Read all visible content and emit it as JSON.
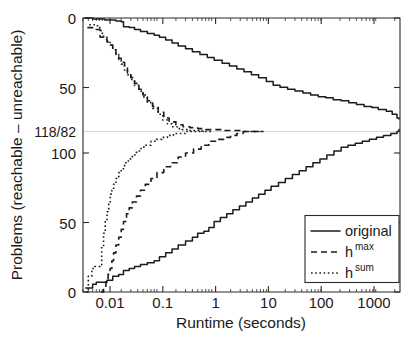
{
  "chart_data": {
    "type": "line",
    "title": "",
    "xlabel": "Runtime (seconds)",
    "ylabel": "Problems (reachable – unreachable)",
    "xscale": "log",
    "xlim": [
      0.004,
      2500
    ],
    "xticks": [
      0.01,
      0.1,
      1,
      10,
      100,
      1000
    ],
    "xticklabels": [
      "0.01",
      "0.1",
      "1",
      "10",
      "100",
      "1000"
    ],
    "yticklabels_top_to_bottom": [
      "0",
      "50",
      "118/82",
      "100",
      "50",
      "0"
    ],
    "ytick_values": [
      0,
      50,
      118,
      100,
      50,
      0
    ],
    "y_axis_note": "Mirrored axis: upper half counts reachable problems solved (0 at top, increasing downward to 118); lower half counts unreachable problems solved (0 at bottom, increasing upward to 82). The 118/82 gridline marks the shared maximum.",
    "reachable_total": 118,
    "unreachable_total": 82,
    "gridline_label": "118/82",
    "grid": "single horizontal gridline at 118/82",
    "legend_position": "lower right",
    "legend": [
      "original",
      "h^max",
      "h^sum"
    ],
    "series": [
      {
        "name": "original",
        "style": "solid",
        "half": "upper",
        "points": [
          [
            0.0045,
            0
          ],
          [
            0.006,
            1
          ],
          [
            0.008,
            1
          ],
          [
            0.01,
            2
          ],
          [
            0.013,
            2
          ],
          [
            0.016,
            3
          ],
          [
            0.02,
            4
          ],
          [
            0.022,
            9
          ],
          [
            0.028,
            10
          ],
          [
            0.035,
            12
          ],
          [
            0.045,
            14
          ],
          [
            0.06,
            16
          ],
          [
            0.08,
            18
          ],
          [
            0.1,
            20
          ],
          [
            0.13,
            23
          ],
          [
            0.17,
            26
          ],
          [
            0.22,
            29
          ],
          [
            0.3,
            32
          ],
          [
            0.4,
            35
          ],
          [
            0.55,
            38
          ],
          [
            0.75,
            41
          ],
          [
            1.0,
            44
          ],
          [
            1.4,
            47
          ],
          [
            1.9,
            50
          ],
          [
            2.6,
            53
          ],
          [
            3.5,
            56
          ],
          [
            4.8,
            59
          ],
          [
            6.5,
            62
          ],
          [
            9,
            66
          ],
          [
            12,
            70
          ],
          [
            16,
            72
          ],
          [
            22,
            74
          ],
          [
            30,
            76
          ],
          [
            42,
            78
          ],
          [
            58,
            80
          ],
          [
            80,
            82
          ],
          [
            110,
            83
          ],
          [
            150,
            85
          ],
          [
            210,
            86
          ],
          [
            290,
            88
          ],
          [
            400,
            90
          ],
          [
            550,
            92
          ],
          [
            760,
            93
          ],
          [
            1000,
            95
          ],
          [
            1400,
            97
          ],
          [
            1800,
            100
          ],
          [
            2200,
            104
          ],
          [
            2400,
            105
          ]
        ]
      },
      {
        "name": "original",
        "style": "solid",
        "half": "lower",
        "points": [
          [
            0.0045,
            2
          ],
          [
            0.006,
            4
          ],
          [
            0.007,
            5
          ],
          [
            0.009,
            5
          ],
          [
            0.011,
            6
          ],
          [
            0.014,
            8
          ],
          [
            0.018,
            9
          ],
          [
            0.022,
            11
          ],
          [
            0.028,
            12
          ],
          [
            0.035,
            13
          ],
          [
            0.045,
            14
          ],
          [
            0.06,
            15
          ],
          [
            0.08,
            16
          ],
          [
            0.1,
            18
          ],
          [
            0.13,
            20
          ],
          [
            0.17,
            22
          ],
          [
            0.22,
            24
          ],
          [
            0.3,
            26
          ],
          [
            0.4,
            28
          ],
          [
            0.5,
            30
          ],
          [
            0.65,
            31
          ],
          [
            0.8,
            33
          ],
          [
            1.0,
            36
          ],
          [
            1.3,
            38
          ],
          [
            1.7,
            40
          ],
          [
            2.2,
            42
          ],
          [
            2.9,
            44
          ],
          [
            3.8,
            46
          ],
          [
            5,
            48
          ],
          [
            6.5,
            50
          ],
          [
            8.5,
            52
          ],
          [
            11,
            54
          ],
          [
            15,
            56
          ],
          [
            20,
            58
          ],
          [
            27,
            60
          ],
          [
            36,
            62
          ],
          [
            48,
            64
          ],
          [
            64,
            66
          ],
          [
            86,
            68
          ],
          [
            115,
            70
          ],
          [
            155,
            72
          ],
          [
            210,
            74
          ],
          [
            280,
            75
          ],
          [
            380,
            76
          ],
          [
            510,
            77
          ],
          [
            690,
            78
          ],
          [
            930,
            79
          ],
          [
            1250,
            80
          ],
          [
            1700,
            81
          ],
          [
            2200,
            82
          ],
          [
            2400,
            83
          ]
        ]
      },
      {
        "name": "h^max",
        "style": "dashed",
        "half": "upper",
        "points": [
          [
            0.0048,
            10
          ],
          [
            0.006,
            11
          ],
          [
            0.007,
            12
          ],
          [
            0.0078,
            12
          ],
          [
            0.0082,
            20
          ],
          [
            0.0095,
            22
          ],
          [
            0.011,
            25
          ],
          [
            0.0125,
            28
          ],
          [
            0.014,
            33
          ],
          [
            0.016,
            38
          ],
          [
            0.018,
            42
          ],
          [
            0.02,
            46
          ],
          [
            0.023,
            52
          ],
          [
            0.026,
            57
          ],
          [
            0.03,
            62
          ],
          [
            0.035,
            68
          ],
          [
            0.042,
            74
          ],
          [
            0.05,
            80
          ],
          [
            0.06,
            86
          ],
          [
            0.075,
            92
          ],
          [
            0.095,
            98
          ],
          [
            0.12,
            104
          ],
          [
            0.15,
            108
          ],
          [
            0.2,
            111
          ],
          [
            0.27,
            113
          ],
          [
            0.36,
            114
          ],
          [
            0.5,
            115
          ],
          [
            0.7,
            116
          ],
          [
            1.0,
            116
          ],
          [
            1.5,
            117
          ],
          [
            2.2,
            117
          ],
          [
            3.2,
            118
          ],
          [
            5,
            118
          ],
          [
            8,
            118
          ]
        ]
      },
      {
        "name": "h^max",
        "style": "dashed",
        "half": "lower",
        "points": [
          [
            0.0085,
            0
          ],
          [
            0.0095,
            3
          ],
          [
            0.0105,
            6
          ],
          [
            0.0115,
            9
          ],
          [
            0.0125,
            12
          ],
          [
            0.0135,
            16
          ],
          [
            0.0145,
            20
          ],
          [
            0.016,
            24
          ],
          [
            0.018,
            28
          ],
          [
            0.02,
            32
          ],
          [
            0.022,
            36
          ],
          [
            0.025,
            40
          ],
          [
            0.028,
            43
          ],
          [
            0.032,
            46
          ],
          [
            0.038,
            49
          ],
          [
            0.045,
            52
          ],
          [
            0.055,
            55
          ],
          [
            0.07,
            58
          ],
          [
            0.09,
            61
          ],
          [
            0.12,
            64
          ],
          [
            0.16,
            66
          ],
          [
            0.22,
            69
          ],
          [
            0.3,
            71
          ],
          [
            0.42,
            73
          ],
          [
            0.58,
            75
          ],
          [
            0.8,
            77
          ],
          [
            1.1,
            78
          ],
          [
            1.5,
            79
          ],
          [
            2.0,
            80
          ],
          [
            2.6,
            81
          ],
          [
            3.4,
            82
          ],
          [
            4.5,
            82
          ],
          [
            6,
            82
          ],
          [
            8,
            82
          ]
        ]
      },
      {
        "name": "h^sum",
        "style": "dotted",
        "half": "upper",
        "points": [
          [
            0.0052,
            7
          ],
          [
            0.006,
            7
          ],
          [
            0.0068,
            8
          ],
          [
            0.0078,
            10
          ],
          [
            0.0085,
            16
          ],
          [
            0.0095,
            20
          ],
          [
            0.011,
            24
          ],
          [
            0.0125,
            28
          ],
          [
            0.014,
            33
          ],
          [
            0.016,
            38
          ],
          [
            0.018,
            43
          ],
          [
            0.02,
            48
          ],
          [
            0.023,
            54
          ],
          [
            0.026,
            59
          ],
          [
            0.03,
            64
          ],
          [
            0.035,
            70
          ],
          [
            0.042,
            76
          ],
          [
            0.05,
            82
          ],
          [
            0.06,
            88
          ],
          [
            0.075,
            94
          ],
          [
            0.095,
            100
          ],
          [
            0.115,
            106
          ],
          [
            0.14,
            110
          ],
          [
            0.17,
            113
          ],
          [
            0.21,
            115
          ],
          [
            0.26,
            116
          ],
          [
            0.33,
            117
          ],
          [
            0.45,
            117
          ],
          [
            0.6,
            118
          ],
          [
            0.9,
            118
          ]
        ]
      },
      {
        "name": "h^sum",
        "style": "dotted",
        "half": "lower",
        "points": [
          [
            0.0046,
            0
          ],
          [
            0.005,
            8
          ],
          [
            0.0058,
            12
          ],
          [
            0.0065,
            13
          ],
          [
            0.0075,
            13
          ],
          [
            0.0082,
            14
          ],
          [
            0.0088,
            23
          ],
          [
            0.0095,
            30
          ],
          [
            0.0102,
            36
          ],
          [
            0.011,
            41
          ],
          [
            0.0118,
            46
          ],
          [
            0.0126,
            50
          ],
          [
            0.0135,
            52
          ],
          [
            0.0145,
            55
          ],
          [
            0.016,
            58
          ],
          [
            0.018,
            61
          ],
          [
            0.02,
            63
          ],
          [
            0.023,
            66
          ],
          [
            0.027,
            68
          ],
          [
            0.032,
            70
          ],
          [
            0.038,
            72
          ],
          [
            0.046,
            74
          ],
          [
            0.056,
            75
          ],
          [
            0.07,
            77
          ],
          [
            0.088,
            78
          ],
          [
            0.11,
            79
          ],
          [
            0.14,
            80
          ],
          [
            0.18,
            81
          ],
          [
            0.24,
            81
          ],
          [
            0.32,
            82
          ],
          [
            0.45,
            82
          ],
          [
            0.65,
            82
          ]
        ]
      }
    ]
  },
  "axes": {
    "y_title": "Problems (reachable – unreachable)",
    "x_title": "Runtime (seconds)",
    "y_labels": {
      "top_zero": "0",
      "upper_fifty": "50",
      "midline": "118/82",
      "hundred": "100",
      "lower_fifty": "50",
      "bottom_zero": "0"
    },
    "x_labels": {
      "t1": "0.01",
      "t2": "0.1",
      "t3": "1",
      "t4": "10",
      "t5": "100",
      "t6": "1000"
    }
  },
  "legend": {
    "items": [
      {
        "label": "original",
        "base": "original",
        "sup": "",
        "style": "solid"
      },
      {
        "label": "h^max",
        "base": "h",
        "sup": "max",
        "style": "dashed"
      },
      {
        "label": "h^sum",
        "base": "h",
        "sup": "sum",
        "style": "dotted"
      }
    ]
  },
  "colors": {
    "ink": "#1c1c1c",
    "axis": "#2b2b2b",
    "grid": "#c9c9c9",
    "background": "#ffffff"
  }
}
